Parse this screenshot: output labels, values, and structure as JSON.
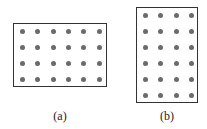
{
  "figures": [
    {
      "id": "a",
      "caption": "(a)",
      "rows": 4,
      "cols": 6,
      "box": {
        "left": 13,
        "top": 23,
        "width": 94,
        "height": 64
      },
      "dot_x": [
        22,
        37,
        53,
        68,
        83,
        99
      ],
      "dot_y": [
        31,
        47,
        63,
        79
      ],
      "caption_pos": {
        "x": 60,
        "y": 109
      }
    },
    {
      "id": "b",
      "caption": "(b)",
      "rows": 6,
      "cols": 4,
      "box": {
        "left": 136,
        "top": 7,
        "width": 62,
        "height": 96
      },
      "dot_x": [
        145,
        160,
        176,
        191
      ],
      "dot_y": [
        15,
        31,
        47,
        63,
        79,
        95
      ],
      "caption_pos": {
        "x": 167,
        "y": 109
      }
    }
  ],
  "colors": {
    "border": "#333333",
    "dot": "#6a6a6a"
  }
}
